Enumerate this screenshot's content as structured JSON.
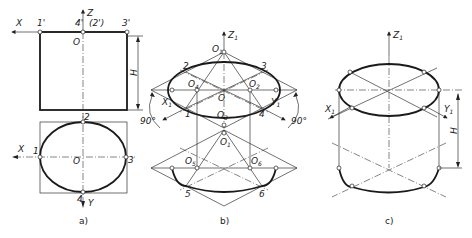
{
  "figure_a": {
    "caption": "a)",
    "front_view": {
      "axis_labels": {
        "x": "X",
        "z": "Z"
      },
      "origin": "O",
      "points": [
        "1'",
        "4'",
        "(2')",
        "3'"
      ],
      "dimension": "H"
    },
    "top_view": {
      "axis_labels": {
        "x": "X",
        "y": "Y"
      },
      "origin": "O",
      "points": [
        "1",
        "2",
        "3",
        "4"
      ]
    }
  },
  "figure_b": {
    "caption": "b)",
    "axis_labels": {
      "z": "Z",
      "x": "X",
      "y": "Y",
      "sub": "1"
    },
    "centers": {
      "o1": "O",
      "o2": "O",
      "o3": "O",
      "o4": "O",
      "o5": "O",
      "o6": "O",
      "o": "O",
      "o1b": "O"
    },
    "center_subs": {
      "o1": "1",
      "o2": "2",
      "o3": "3",
      "o4": "4",
      "o5": "5",
      "o6": "6",
      "o1b": "1"
    },
    "points": [
      "1",
      "2",
      "3",
      "4",
      "5",
      "6"
    ],
    "angles": [
      "90°",
      "90°"
    ]
  },
  "figure_c": {
    "caption": "c)",
    "axis_labels": {
      "z": "Z",
      "x": "X",
      "y": "Y",
      "sub": "1"
    },
    "dimension": "H"
  }
}
